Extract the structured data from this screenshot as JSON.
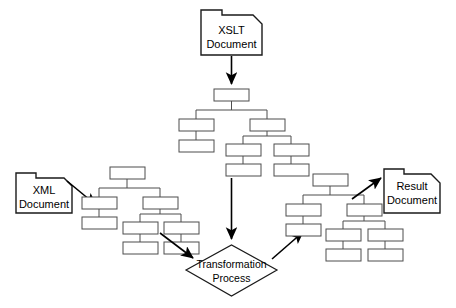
{
  "diagram": {
    "background_color": "#ffffff",
    "line_color": "#4d4d4d",
    "outline_color": "#1a1a1a",
    "arrow_color": "#000000",
    "nodes": {
      "xslt_document": {
        "label_line1": "XSLT",
        "label_line2": "Document",
        "shape": "document-folder"
      },
      "xml_document": {
        "label_line1": "XML",
        "label_line2": "Document",
        "shape": "document-folder"
      },
      "result_document": {
        "label_line1": "Result",
        "label_line2": "Document",
        "shape": "document-folder"
      },
      "transformation_process": {
        "label_line1": "Transformation",
        "label_line2": "Process",
        "shape": "diamond"
      },
      "stylesheet_tree": {
        "name": "XSLT stylesheet tree",
        "node_count": 8
      },
      "source_tree": {
        "name": "XML source tree",
        "node_count": 8
      },
      "result_tree": {
        "name": "Result tree",
        "node_count": 8
      }
    },
    "edges": [
      {
        "from": "xslt_document",
        "to": "stylesheet_tree",
        "style": "arrow-down"
      },
      {
        "from": "stylesheet_tree",
        "to": "transformation_process",
        "style": "arrow-down"
      },
      {
        "from": "xml_document",
        "to": "source_tree",
        "style": "arrow-diagonal"
      },
      {
        "from": "source_tree",
        "to": "transformation_process",
        "style": "arrow-diagonal"
      },
      {
        "from": "transformation_process",
        "to": "result_tree",
        "style": "arrow-diagonal"
      },
      {
        "from": "result_tree",
        "to": "result_document",
        "style": "arrow-diagonal"
      }
    ]
  }
}
